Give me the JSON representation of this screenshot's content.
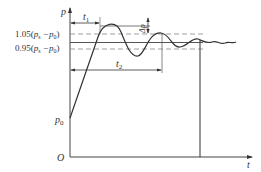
{
  "diagram": {
    "type": "pressure-transient-response",
    "axes": {
      "y_label": "p",
      "x_label": "t",
      "origin_label": "O"
    },
    "labels": {
      "initial_pressure": "p",
      "initial_pressure_sub": "0",
      "upper_band": "1.05(",
      "lower_band": "0.95(",
      "band_ps": "p",
      "band_ps_sub": "s",
      "band_minus": " −p",
      "band_p0_sub": "0",
      "band_close": ")",
      "rise_time": "t",
      "rise_time_sub": "1",
      "settling_time": "t",
      "settling_time_sub": "2",
      "overshoot": "Δp"
    },
    "bands": {
      "upper_factor": 1.05,
      "lower_factor": 0.95
    }
  }
}
